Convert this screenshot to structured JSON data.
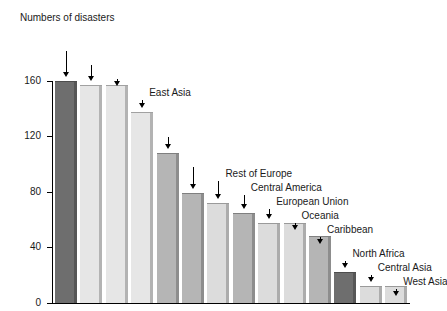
{
  "chart_data": {
    "type": "bar",
    "title": "Numbers of disasters",
    "xlabel": "",
    "ylabel": "",
    "ylim": [
      0,
      160
    ],
    "yticks": [
      0,
      40,
      80,
      120,
      160
    ],
    "ytick_labels": [
      "0",
      "40",
      "80",
      "120",
      "160"
    ],
    "grid": false,
    "legend": "none",
    "label_style": "leader-arrow callouts above each bar",
    "categories": [
      "Sub-Saharan Africa",
      "South Asia",
      "Southeast Asia",
      "East Asia",
      "South America",
      "North America",
      "Rest of Europe",
      "Central America",
      "European Union",
      "Oceania",
      "Caribbean",
      "North Africa",
      "Central Asia",
      "West Asia"
    ],
    "values": [
      160,
      157,
      157,
      138,
      108,
      79,
      72,
      65,
      58,
      58,
      48,
      22,
      12,
      12
    ],
    "bar_colors": [
      "#6e6e6e",
      "#e6e6e6",
      "#e6e6e6",
      "#e6e6e6",
      "#b5b5b5",
      "#b5b5b5",
      "#dcdcdc",
      "#b5b5b5",
      "#dcdcdc",
      "#dcdcdc",
      "#b5b5b5",
      "#6e6e6e",
      "#dcdcdc",
      "#dcdcdc"
    ]
  },
  "chart": {
    "title": "Numbers of disasters",
    "axis_color": "#000000",
    "text_color": "#1a1a1a",
    "background": "#ffffff"
  },
  "ticks": [
    {
      "label": "160"
    },
    {
      "label": "120"
    },
    {
      "label": "80"
    },
    {
      "label": "40"
    },
    {
      "label": "0"
    }
  ],
  "callouts": [
    {
      "label": "Sub-Saharan Africa"
    },
    {
      "label": "South Asia"
    },
    {
      "label": "Southeast Asia"
    },
    {
      "label": "East Asia"
    },
    {
      "label": "South America"
    },
    {
      "label": "North America"
    },
    {
      "label": "Rest of Europe"
    },
    {
      "label": "Central America"
    },
    {
      "label": "European Union"
    },
    {
      "label": "Oceania"
    },
    {
      "label": "Caribbean"
    },
    {
      "label": "North Africa"
    },
    {
      "label": "Central Asia"
    },
    {
      "label": "West Asia"
    }
  ]
}
